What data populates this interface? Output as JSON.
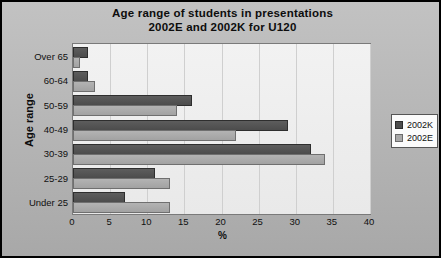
{
  "chart_data": {
    "type": "bar",
    "orientation": "horizontal",
    "title": "Age range of students in presentations 2002E and 2002K for U120",
    "title_lines": [
      "Age range of students in presentations",
      "2002E and 2002K for U120"
    ],
    "xlabel": "%",
    "ylabel": "Age range",
    "categories": [
      "Over 65",
      "60-64",
      "50-59",
      "40-49",
      "30-39",
      "25-29",
      "Under 25"
    ],
    "series": [
      {
        "name": "2002K",
        "color": "#4c4c4c",
        "values": [
          2,
          2,
          16,
          29,
          32,
          11,
          7
        ]
      },
      {
        "name": "2002E",
        "color": "#a9a9a9",
        "values": [
          1,
          3,
          14,
          22,
          34,
          13,
          13
        ]
      }
    ],
    "xlim": [
      0,
      40
    ],
    "xticks": [
      0,
      5,
      10,
      15,
      20,
      25,
      30,
      35,
      40
    ],
    "xtick_labels": [
      "0",
      "5",
      "10",
      "15",
      "20",
      "25",
      "30",
      "35",
      "40"
    ],
    "grid": true,
    "grid_axis": "x",
    "legend_position": "right",
    "legend_entries": [
      "2002K",
      "2002E"
    ],
    "plot_background": "#eeeeee",
    "frame_background": "#b6b6b6",
    "frame_border": "#000000"
  }
}
